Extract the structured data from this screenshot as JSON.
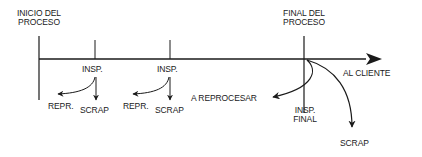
{
  "diagram": {
    "type": "process-inspection-flow",
    "start_label": "INICIO DEL\nPROCESO",
    "start_label_lines": [
      "INICIO DEL",
      "PROCESO"
    ],
    "end_label_lines": [
      "FINAL DEL",
      "PROCESO"
    ],
    "output_label": "AL CLIENTE",
    "inspections": [
      {
        "label": "INSP.",
        "outputs": [
          "REPR.",
          "SCRAP"
        ]
      },
      {
        "label": "INSP.",
        "outputs": [
          "REPR.",
          "SCRAP"
        ]
      }
    ],
    "final_inspection": {
      "label_lines": [
        "INSP.",
        "FINAL"
      ],
      "outputs": [
        "A REPROCESAR",
        "SCRAP"
      ]
    },
    "colors": {
      "line": "#1a1a1a",
      "background": "#ffffff"
    }
  }
}
